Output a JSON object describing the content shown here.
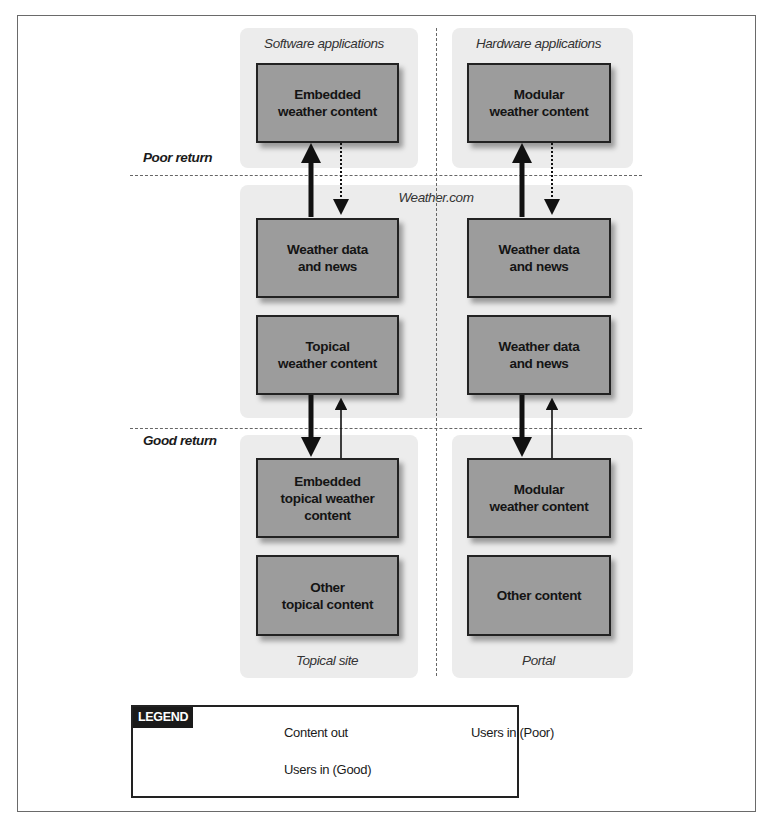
{
  "diagram": {
    "sections": {
      "software": {
        "label": "Software applications",
        "box": "Embedded\nweather content"
      },
      "hardware": {
        "label": "Hardware applications",
        "box": "Modular\nweather content"
      },
      "weathercom": {
        "label": "Weather.com",
        "left_boxes": [
          "Weather data\nand news",
          "Topical\nweather content"
        ],
        "right_boxes": [
          "Weather data\nand news",
          "Weather data\nand news"
        ]
      },
      "topical_site": {
        "label": "Topical site",
        "boxes": [
          "Embedded\ntopical weather\ncontent",
          "Other\ntopical content"
        ]
      },
      "portal": {
        "label": "Portal",
        "boxes": [
          "Modular\nweather content",
          "Other content"
        ]
      }
    },
    "return_labels": {
      "poor": "Poor return",
      "good": "Good return"
    },
    "legend": {
      "title": "LEGEND",
      "items": [
        {
          "style": "thick-solid",
          "label": "Content out"
        },
        {
          "style": "dotted",
          "label": "Users in (Poor)"
        },
        {
          "style": "thin-solid",
          "label": "Users in (Good)"
        }
      ]
    },
    "colors": {
      "box_fill": "#9c9c9c",
      "region_fill": "#ececec",
      "border": "#222222"
    }
  }
}
